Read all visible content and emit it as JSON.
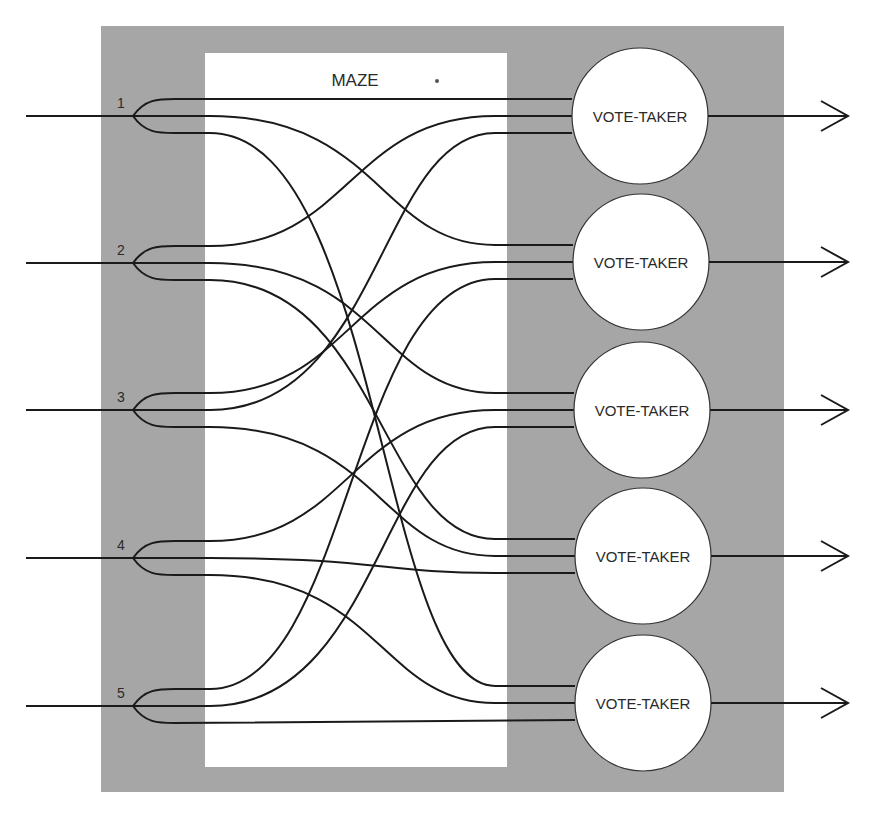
{
  "diagram": {
    "maze_label": "MAZE",
    "voter_label": "VOTE-TAKER",
    "inputs": [
      {
        "label": "1",
        "y": 116
      },
      {
        "label": "2",
        "y": 263
      },
      {
        "label": "3",
        "y": 410
      },
      {
        "label": "4",
        "y": 558
      },
      {
        "label": "5",
        "y": 706
      }
    ],
    "voters": [
      {
        "label": "VOTE-TAKER",
        "cx": 640,
        "cy": 116
      },
      {
        "label": "VOTE-TAKER",
        "cx": 641,
        "cy": 262
      },
      {
        "label": "VOTE-TAKER",
        "cx": 642,
        "cy": 410
      },
      {
        "label": "VOTE-TAKER",
        "cx": 643,
        "cy": 556
      },
      {
        "label": "VOTE-TAKER",
        "cx": 643,
        "cy": 703
      }
    ],
    "connections": [
      {
        "from": "1",
        "branch": "top",
        "to": 1,
        "slot": "top"
      },
      {
        "from": "1",
        "branch": "middle",
        "to": 2,
        "slot": "top"
      },
      {
        "from": "1",
        "branch": "bottom",
        "to": 5,
        "slot": "top"
      },
      {
        "from": "2",
        "branch": "top",
        "to": 1,
        "slot": "middle"
      },
      {
        "from": "2",
        "branch": "middle",
        "to": 3,
        "slot": "top"
      },
      {
        "from": "2",
        "branch": "bottom",
        "to": 4,
        "slot": "top"
      },
      {
        "from": "3",
        "branch": "top",
        "to": 2,
        "slot": "middle"
      },
      {
        "from": "3",
        "branch": "middle",
        "to": 1,
        "slot": "bottom"
      },
      {
        "from": "3",
        "branch": "bottom",
        "to": 4,
        "slot": "middle"
      },
      {
        "from": "4",
        "branch": "top",
        "to": 3,
        "slot": "middle"
      },
      {
        "from": "4",
        "branch": "middle",
        "to": 4,
        "slot": "bottom"
      },
      {
        "from": "4",
        "branch": "bottom",
        "to": 5,
        "slot": "middle"
      },
      {
        "from": "5",
        "branch": "top",
        "to": 2,
        "slot": "bottom"
      },
      {
        "from": "5",
        "branch": "middle",
        "to": 3,
        "slot": "bottom"
      },
      {
        "from": "5",
        "branch": "bottom",
        "to": 5,
        "slot": "bottom"
      }
    ],
    "colors": {
      "panel": "#a6a6a6",
      "maze": "#ffffff",
      "wire": "#1a1a1a",
      "circle_fill": "#ffffff"
    }
  }
}
